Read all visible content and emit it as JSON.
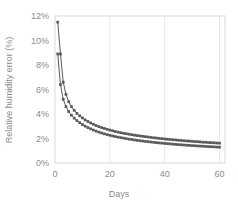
{
  "chart_data": {
    "type": "line",
    "title": "",
    "xlabel": "Days",
    "ylabel": "Relative humidity error (%)",
    "xlim": [
      0,
      62
    ],
    "ylim": [
      0,
      12
    ],
    "xticks": [
      "0",
      "20",
      "40",
      "60"
    ],
    "xtick_values": [
      0,
      20,
      40,
      60
    ],
    "yticks": [
      "0%",
      "2%",
      "4%",
      "6%",
      "8%",
      "10%",
      "12%"
    ],
    "ytick_values": [
      0,
      2,
      4,
      6,
      8,
      10,
      12
    ],
    "grid": "vertical-only",
    "legend": "none",
    "marker": "square",
    "series_color": "#595959",
    "grid_color": "#e8e8e8",
    "axis_color": "#d9d9d9",
    "label_color": "#8c8c8c",
    "x": [
      1,
      2,
      3,
      4,
      5,
      6,
      7,
      8,
      9,
      10,
      11,
      12,
      13,
      14,
      15,
      16,
      17,
      18,
      19,
      20,
      21,
      22,
      23,
      24,
      25,
      26,
      27,
      28,
      29,
      30,
      31,
      32,
      33,
      34,
      35,
      36,
      37,
      38,
      39,
      40,
      41,
      42,
      43,
      44,
      45,
      46,
      47,
      48,
      49,
      50,
      51,
      52,
      53,
      54,
      55,
      56,
      57,
      58,
      59,
      60
    ],
    "series": [
      {
        "name": "upper",
        "values": [
          11.5,
          8.9,
          6.6,
          5.6,
          5.0,
          4.6,
          4.3,
          4.05,
          3.85,
          3.68,
          3.52,
          3.39,
          3.27,
          3.16,
          3.06,
          2.97,
          2.89,
          2.82,
          2.75,
          2.69,
          2.63,
          2.57,
          2.52,
          2.47,
          2.43,
          2.39,
          2.35,
          2.31,
          2.27,
          2.24,
          2.21,
          2.18,
          2.15,
          2.12,
          2.09,
          2.06,
          2.04,
          2.01,
          1.99,
          1.96,
          1.94,
          1.92,
          1.9,
          1.88,
          1.86,
          1.84,
          1.82,
          1.8,
          1.79,
          1.77,
          1.75,
          1.74,
          1.72,
          1.7,
          1.69,
          1.67,
          1.66,
          1.65,
          1.63,
          1.62
        ]
      },
      {
        "name": "lower",
        "values": [
          8.9,
          6.4,
          5.2,
          4.6,
          4.2,
          3.9,
          3.66,
          3.46,
          3.29,
          3.14,
          3.01,
          2.89,
          2.79,
          2.69,
          2.6,
          2.52,
          2.45,
          2.38,
          2.32,
          2.26,
          2.21,
          2.16,
          2.11,
          2.07,
          2.03,
          1.99,
          1.95,
          1.92,
          1.88,
          1.85,
          1.82,
          1.79,
          1.76,
          1.74,
          1.71,
          1.69,
          1.66,
          1.64,
          1.62,
          1.6,
          1.58,
          1.56,
          1.54,
          1.52,
          1.5,
          1.49,
          1.47,
          1.45,
          1.44,
          1.42,
          1.41,
          1.39,
          1.38,
          1.37,
          1.35,
          1.34,
          1.33,
          1.32,
          1.3,
          1.29
        ]
      }
    ]
  }
}
